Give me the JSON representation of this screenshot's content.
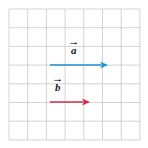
{
  "figure": {
    "background_color": "#ffffff"
  },
  "grid": {
    "name": "square-grid",
    "columns": 7,
    "rows": 7,
    "cell_size_px": 18.7,
    "origin_x_px": 9,
    "origin_y_px": 9,
    "line_color": "#c8c8c8",
    "line_width_px": 0.8
  },
  "vectors": [
    {
      "id": "vector-a",
      "label": "a",
      "accent": "arrow-over",
      "color": "#1f8fd8",
      "start_x": 50,
      "start_y": 65,
      "end_x": 108,
      "end_y": 65,
      "length_cells": 3,
      "direction": "right",
      "label_x": 71,
      "label_y": 45
    },
    {
      "id": "vector-b",
      "label": "b",
      "accent": "arrow-over",
      "color": "#d42a4a",
      "start_x": 50,
      "start_y": 102,
      "end_x": 90,
      "end_y": 102,
      "length_cells": 2,
      "direction": "right",
      "label_x": 55,
      "label_y": 82
    }
  ],
  "chart_data": {
    "type": "scatter",
    "xlabel": "",
    "ylabel": "",
    "xlim": [
      0,
      7
    ],
    "ylim": [
      0,
      7
    ],
    "grid": true,
    "legend": "none",
    "annotations": [
      "a",
      "b"
    ],
    "series": [
      {
        "name": "a",
        "type": "vector",
        "color": "#1f8fd8",
        "tail": [
          2.2,
          4.0
        ],
        "head": [
          5.3,
          4.0
        ],
        "components": [
          3.1,
          0
        ]
      },
      {
        "name": "b",
        "type": "vector",
        "color": "#d42a4a",
        "tail": [
          2.2,
          2.0
        ],
        "head": [
          4.3,
          2.0
        ],
        "components": [
          2.1,
          0
        ]
      }
    ]
  }
}
